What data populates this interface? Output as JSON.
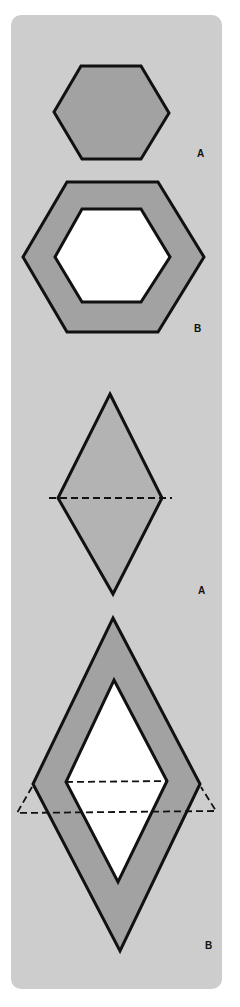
{
  "colors": {
    "page": "#ffffff",
    "panel": "#cdcdcd",
    "shape_fill": "#a2a2a2",
    "shape_fill_light": "#b3b3b3",
    "hole": "#ffffff",
    "outline": "#111111"
  },
  "figures": [
    {
      "id": "hexagon-a",
      "label": "A",
      "description": "Solid hexagon"
    },
    {
      "id": "hexagon-b",
      "label": "B",
      "description": "Hexagonal frame with hexagonal hole"
    },
    {
      "id": "rhombus-a",
      "label": "A",
      "description": "Rhombus split by dashed diagonal into two triangles"
    },
    {
      "id": "rhombus-b",
      "label": "B",
      "description": "Rhombus frame with rhombus hole and dashed triangle extension"
    }
  ]
}
